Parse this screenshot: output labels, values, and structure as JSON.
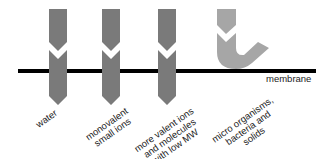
{
  "diagram": {
    "membrane_label": "membrane",
    "colors": {
      "arrow_fill": "#7a7a7a",
      "u_arrow_fill": "#a6a6a6",
      "membrane": "#000000",
      "text": "#222222"
    },
    "items": [
      {
        "label_line1": "water",
        "label_line2": "",
        "label_line3": "",
        "passes": true
      },
      {
        "label_line1": "monovalent",
        "label_line2": "small ions",
        "label_line3": "",
        "passes": true
      },
      {
        "label_line1": "more valent ions",
        "label_line2": "and molecules",
        "label_line3": "with low MW",
        "passes": true
      },
      {
        "label_line1": "micro organisms,",
        "label_line2": "bacteria and",
        "label_line3": "solids",
        "passes": false
      }
    ]
  }
}
